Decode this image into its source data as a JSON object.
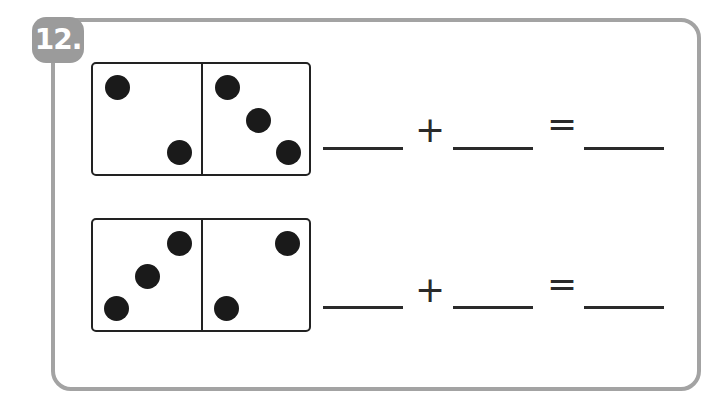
{
  "problem": {
    "number_label": "12.",
    "badge_color": "#9b9b9b",
    "frame_color": "#a3a3a3"
  },
  "rows": [
    {
      "domino": {
        "left_pips": 2,
        "right_pips": 3
      },
      "equation": {
        "blank1": "",
        "plus": "+",
        "blank2": "",
        "equals": "=",
        "blank3": ""
      }
    },
    {
      "domino": {
        "left_pips": 3,
        "right_pips": 2
      },
      "equation": {
        "blank1": "",
        "plus": "+",
        "blank2": "",
        "equals": "=",
        "blank3": ""
      }
    }
  ]
}
